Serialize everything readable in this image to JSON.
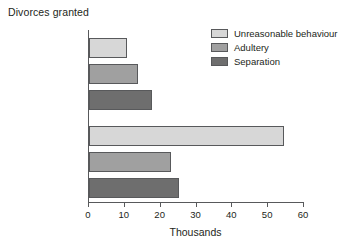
{
  "chart_data": {
    "type": "bar",
    "orientation": "horizontal",
    "title": "Divorces granted",
    "xlabel": "Thousands",
    "ylabel": "",
    "xlim": [
      0,
      60
    ],
    "xticks": [
      0,
      10,
      20,
      30,
      40,
      50,
      60
    ],
    "grid": false,
    "legend_position": "top-right",
    "categories": [
      "To husbands",
      "To wives"
    ],
    "series": [
      {
        "name": "Unreasonable behaviour",
        "color": "#d7d7d7",
        "values": [
          10.5,
          54.5
        ]
      },
      {
        "name": "Adultery",
        "color": "#a0a0a0",
        "values": [
          13.7,
          22.9
        ]
      },
      {
        "name": "Separation",
        "color": "#6e6e6e",
        "values": [
          17.6,
          25.1
        ]
      }
    ]
  },
  "axis": {
    "tick_labels": [
      "0",
      "10",
      "20",
      "30",
      "40",
      "50",
      "60"
    ],
    "title": "Thousands"
  },
  "legend": {
    "items": [
      {
        "label": "Unreasonable behaviour",
        "color": "#d7d7d7"
      },
      {
        "label": "Adultery",
        "color": "#a0a0a0"
      },
      {
        "label": "Separation",
        "color": "#6e6e6e"
      }
    ]
  },
  "groups": [
    {
      "label": "To husbands"
    },
    {
      "label": "To wives"
    }
  ],
  "title": "Divorces granted"
}
